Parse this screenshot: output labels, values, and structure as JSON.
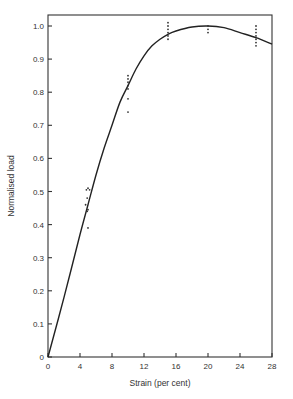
{
  "chart_data": {
    "type": "scatter",
    "title": "",
    "xlabel": "Strain (per cent)",
    "ylabel": "Normalised load",
    "xlim": [
      0,
      28
    ],
    "ylim": [
      0,
      1.0
    ],
    "grid": false,
    "legend": null,
    "x_ticks": [
      0,
      4,
      8,
      12,
      16,
      20,
      24,
      28
    ],
    "x_tick_labels": [
      "0",
      "4",
      "8",
      "12",
      "16",
      "20",
      "24",
      "28"
    ],
    "y_ticks": [
      0,
      0.1,
      0.2,
      0.3,
      0.4,
      0.5,
      0.6,
      0.7,
      0.8,
      0.9,
      1.0
    ],
    "y_tick_labels": [
      "0",
      "0.1",
      "0.2",
      "0.3",
      "0.4",
      "0.5",
      "0.6",
      "0.7",
      "0.8",
      "0.9",
      "1.0"
    ],
    "series": [
      {
        "name": "measurements",
        "kind": "scatter",
        "points": [
          {
            "x": 4.8,
            "y": 0.505
          },
          {
            "x": 5.0,
            "y": 0.51
          },
          {
            "x": 5.2,
            "y": 0.505
          },
          {
            "x": 4.9,
            "y": 0.48
          },
          {
            "x": 4.7,
            "y": 0.46
          },
          {
            "x": 5.0,
            "y": 0.445
          },
          {
            "x": 4.9,
            "y": 0.44
          },
          {
            "x": 5.0,
            "y": 0.39
          },
          {
            "x": 10.0,
            "y": 0.85
          },
          {
            "x": 10.0,
            "y": 0.84
          },
          {
            "x": 10.0,
            "y": 0.83
          },
          {
            "x": 10.0,
            "y": 0.82
          },
          {
            "x": 10.0,
            "y": 0.81
          },
          {
            "x": 10.0,
            "y": 0.78
          },
          {
            "x": 10.0,
            "y": 0.74
          },
          {
            "x": 15.0,
            "y": 1.01
          },
          {
            "x": 15.0,
            "y": 1.0
          },
          {
            "x": 15.0,
            "y": 0.99
          },
          {
            "x": 15.0,
            "y": 0.98
          },
          {
            "x": 15.0,
            "y": 0.97
          },
          {
            "x": 15.0,
            "y": 0.96
          },
          {
            "x": 20.0,
            "y": 1.0
          },
          {
            "x": 20.0,
            "y": 0.99
          },
          {
            "x": 20.0,
            "y": 0.98
          },
          {
            "x": 26.0,
            "y": 1.0
          },
          {
            "x": 26.0,
            "y": 0.99
          },
          {
            "x": 26.0,
            "y": 0.98
          },
          {
            "x": 26.0,
            "y": 0.97
          },
          {
            "x": 26.0,
            "y": 0.96
          },
          {
            "x": 26.0,
            "y": 0.95
          },
          {
            "x": 26.0,
            "y": 0.94
          }
        ]
      },
      {
        "name": "fitted curve",
        "kind": "line",
        "points": [
          {
            "x": 0,
            "y": 0
          },
          {
            "x": 2,
            "y": 0.18
          },
          {
            "x": 4,
            "y": 0.37
          },
          {
            "x": 5,
            "y": 0.46
          },
          {
            "x": 6,
            "y": 0.55
          },
          {
            "x": 7,
            "y": 0.63
          },
          {
            "x": 8,
            "y": 0.7
          },
          {
            "x": 9,
            "y": 0.77
          },
          {
            "x": 10,
            "y": 0.82
          },
          {
            "x": 11,
            "y": 0.87
          },
          {
            "x": 12,
            "y": 0.91
          },
          {
            "x": 13,
            "y": 0.94
          },
          {
            "x": 14,
            "y": 0.96
          },
          {
            "x": 15,
            "y": 0.975
          },
          {
            "x": 16,
            "y": 0.985
          },
          {
            "x": 18,
            "y": 0.997
          },
          {
            "x": 20,
            "y": 1.0
          },
          {
            "x": 22,
            "y": 0.995
          },
          {
            "x": 24,
            "y": 0.98
          },
          {
            "x": 26,
            "y": 0.965
          },
          {
            "x": 28,
            "y": 0.945
          }
        ]
      }
    ]
  },
  "colors": {
    "axis": "#333333",
    "curve": "#222222",
    "points": "#333333",
    "background": "#ffffff"
  }
}
